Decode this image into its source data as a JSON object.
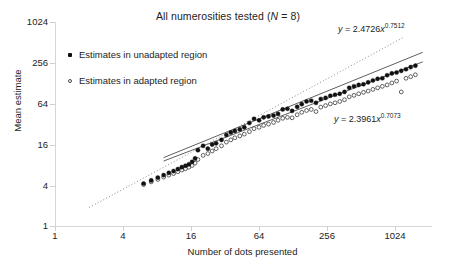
{
  "chart_data": {
    "type": "scatter",
    "title": "All numerosities tested (N = 8)",
    "title_plain": "All numerosities tested",
    "sample_size_label": "N = 8",
    "xlabel": "Number of dots presented",
    "ylabel": "Mean estimate",
    "xscale": "log",
    "yscale": "log",
    "log_base": 4,
    "xlim": [
      1,
      2048
    ],
    "ylim": [
      1,
      2048
    ],
    "xticks": [
      1,
      4,
      16,
      64,
      256,
      1024
    ],
    "xtick_labels": [
      "1",
      "4",
      "16",
      "64",
      "256",
      "1024"
    ],
    "yticks": [
      1,
      4,
      16,
      64,
      256,
      1024
    ],
    "ytick_labels": [
      "1",
      "4",
      "16",
      "64",
      "256",
      "1024"
    ],
    "grid": false,
    "legend_position": "upper-left-inside",
    "legend": [
      {
        "marker": "filled-square",
        "label": "Estimates in unadapted region"
      },
      {
        "marker": "open-circle",
        "label": "Estimates in adapted region"
      }
    ],
    "annotations": [
      {
        "id": "eq-unadapted",
        "text": "y = 2.4726x^0.7512",
        "y_var": "y",
        "coefficient": 2.4726,
        "exponent": 0.7512,
        "series": "Estimates in unadapted region"
      },
      {
        "id": "eq-adapted",
        "text": "y = 2.3961x^0.7073",
        "y_var": "y",
        "coefficient": 2.3961,
        "exponent": 0.7073,
        "series": "Estimates in adapted region"
      }
    ],
    "reference_line": {
      "style": "dotted",
      "description": "identity line y = x",
      "slope": 1,
      "intercept": 0
    },
    "fit_lines": [
      {
        "series": "Estimates in unadapted region",
        "style": "solid",
        "coefficient": 2.4726,
        "exponent": 0.7512
      },
      {
        "series": "Estimates in adapted region",
        "style": "solid",
        "coefficient": 2.3961,
        "exponent": 0.7073
      }
    ],
    "series": [
      {
        "name": "Estimates in unadapted region",
        "marker": "filled-circle",
        "x": [
          6,
          7,
          8,
          9,
          10,
          11,
          12,
          13,
          14,
          15,
          16,
          17,
          18,
          20,
          22,
          24,
          26,
          29,
          32,
          35,
          38,
          42,
          46,
          51,
          56,
          62,
          68,
          75,
          83,
          91,
          100,
          110,
          121,
          134,
          147,
          162,
          178,
          196,
          216,
          238,
          262,
          288,
          317,
          349,
          384,
          423,
          465,
          512,
          563,
          620,
          682,
          750,
          826,
          909,
          1000,
          1100,
          1210,
          1331,
          1464
        ],
        "y": [
          4.9,
          5.5,
          6.1,
          6.7,
          7.3,
          7.8,
          8.4,
          9.0,
          9.5,
          10.0,
          11.0,
          12.5,
          17.0,
          20.0,
          18.0,
          21.0,
          22.0,
          25.0,
          30.0,
          33.0,
          35.0,
          37.0,
          40.0,
          47.0,
          55.0,
          52.0,
          58.0,
          60.0,
          62.0,
          66.0,
          78.0,
          80.0,
          74.0,
          86.0,
          95.0,
          105.0,
          108.0,
          100.0,
          115.0,
          120.0,
          130.0,
          135.0,
          140.0,
          150.0,
          175.0,
          185.0,
          195.0,
          200.0,
          215.0,
          230.0,
          245.0,
          250.0,
          280.0,
          300.0,
          310.0,
          330.0,
          350.0,
          380.0,
          400.0
        ]
      },
      {
        "name": "Estimates in adapted region",
        "marker": "open-circle",
        "x": [
          6,
          7,
          8,
          9,
          10,
          11,
          12,
          13,
          14,
          15,
          16,
          17,
          18,
          20,
          22,
          24,
          26,
          29,
          32,
          35,
          38,
          42,
          46,
          51,
          56,
          62,
          68,
          75,
          83,
          91,
          100,
          110,
          121,
          134,
          147,
          162,
          178,
          196,
          216,
          238,
          262,
          288,
          317,
          349,
          384,
          423,
          465,
          512,
          563,
          620,
          682,
          750,
          826,
          909,
          1000,
          1100,
          1210,
          1331,
          1464
        ],
        "y": [
          4.7,
          5.2,
          5.7,
          6.2,
          6.7,
          7.1,
          7.6,
          8.1,
          8.5,
          9.0,
          9.6,
          10.5,
          12.0,
          14.0,
          15.0,
          16.5,
          18.0,
          20.0,
          23.0,
          25.0,
          27.0,
          29.0,
          31.0,
          34.0,
          38.0,
          40.0,
          43.0,
          45.0,
          48.0,
          52.0,
          56.0,
          58.0,
          57.0,
          64.0,
          70.0,
          75.0,
          78.0,
          72.0,
          85.0,
          90.0,
          96.0,
          100.0,
          105.0,
          112.0,
          125.0,
          132.0,
          140.0,
          148.0,
          155.0,
          165.0,
          175.0,
          185.0,
          195.0,
          210.0,
          225.0,
          150.0,
          250.0,
          265.0,
          285.0
        ]
      }
    ]
  }
}
